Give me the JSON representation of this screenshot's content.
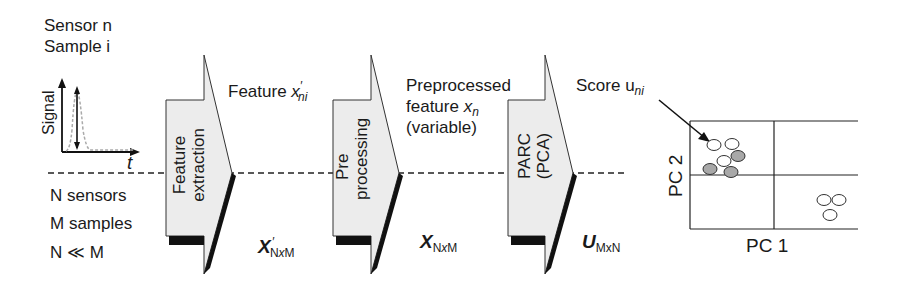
{
  "left": {
    "sensor_line": "Sensor n",
    "sample_line": "Sample i",
    "signal_axis": "Signal",
    "time_axis": "t",
    "n_sensors": "N sensors",
    "m_samples": "M samples",
    "relation": "N ≪ M"
  },
  "stages": [
    {
      "line1": "Feature",
      "line2": "extraction"
    },
    {
      "line1": "Pre",
      "line2": "processing"
    },
    {
      "line1": "PARC",
      "line2": "(PCA)"
    }
  ],
  "annotations": {
    "feature_label": "Feature",
    "feature_var": "x",
    "feature_prime": "′",
    "feature_sub": "ni",
    "pre_line1": "Preprocessed",
    "pre_line2": "feature",
    "pre_var": "x",
    "pre_sub": "n",
    "pre_line3": "(variable)",
    "score_label": "Score u",
    "score_sub": "ni"
  },
  "matrices": [
    {
      "symbol": "X",
      "prime": "′",
      "sub_a": "N",
      "sub_x": "x",
      "sub_b": "M"
    },
    {
      "symbol": "X",
      "prime": "",
      "sub_a": "N",
      "sub_x": "x",
      "sub_b": "M"
    },
    {
      "symbol": "U",
      "prime": "",
      "sub_a": "M",
      "sub_x": "x",
      "sub_b": "N"
    }
  ],
  "score_plot": {
    "xlabel": "PC 1",
    "ylabel": "PC 2",
    "open_points": [
      [
        752,
        158
      ],
      [
        738,
        167
      ],
      [
        722,
        163
      ],
      [
        821,
        200
      ],
      [
        835,
        200
      ],
      [
        826,
        214
      ]
    ],
    "filled_points": [
      [
        738,
        155
      ],
      [
        710,
        168
      ],
      [
        730,
        171
      ]
    ],
    "fill_color": "#a8a8a8"
  }
}
